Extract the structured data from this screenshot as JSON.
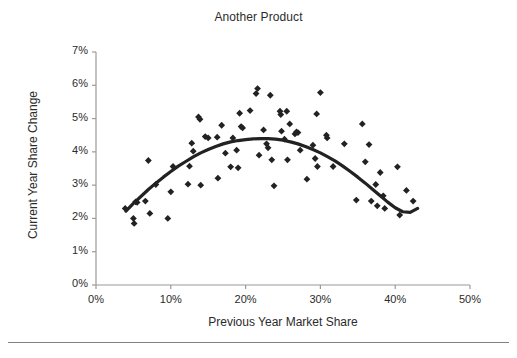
{
  "chart_data": {
    "type": "scatter",
    "title": "Another Product",
    "xlabel": "Previous Year Market Share",
    "ylabel": "Current Year Share Change",
    "xlim": [
      0,
      50
    ],
    "ylim": [
      0,
      7
    ],
    "x_ticks": [
      "0%",
      "10%",
      "20%",
      "30%",
      "40%",
      "50%"
    ],
    "x_tick_values": [
      0,
      10,
      20,
      30,
      40,
      50
    ],
    "y_ticks": [
      "0%",
      "1%",
      "2%",
      "3%",
      "4%",
      "5%",
      "6%",
      "7%"
    ],
    "y_tick_values": [
      0,
      1,
      2,
      3,
      4,
      5,
      6,
      7
    ],
    "grid": false,
    "legend": "none",
    "marker": "diamond",
    "marker_color": "#222222",
    "trendline": {
      "type": "polynomial-quadratic",
      "color": "#222222",
      "width": 3.2,
      "points": [
        [
          4.0,
          2.22
        ],
        [
          5.0,
          2.45
        ],
        [
          6.0,
          2.66
        ],
        [
          7.0,
          2.87
        ],
        [
          8.0,
          3.06
        ],
        [
          9.0,
          3.24
        ],
        [
          10.0,
          3.41
        ],
        [
          11.0,
          3.57
        ],
        [
          12.0,
          3.71
        ],
        [
          13.0,
          3.85
        ],
        [
          14.0,
          3.97
        ],
        [
          15.0,
          4.07
        ],
        [
          16.0,
          4.16
        ],
        [
          17.0,
          4.24
        ],
        [
          18.0,
          4.3
        ],
        [
          19.0,
          4.34
        ],
        [
          20.0,
          4.37
        ],
        [
          21.0,
          4.39
        ],
        [
          22.0,
          4.4
        ],
        [
          23.0,
          4.4
        ],
        [
          24.0,
          4.38
        ],
        [
          25.0,
          4.35
        ],
        [
          26.0,
          4.3
        ],
        [
          27.0,
          4.24
        ],
        [
          28.0,
          4.16
        ],
        [
          29.0,
          4.07
        ],
        [
          30.0,
          3.97
        ],
        [
          31.0,
          3.85
        ],
        [
          32.0,
          3.72
        ],
        [
          33.0,
          3.57
        ],
        [
          34.0,
          3.41
        ],
        [
          35.0,
          3.24
        ],
        [
          36.0,
          3.06
        ],
        [
          37.0,
          2.87
        ],
        [
          38.0,
          2.68
        ],
        [
          39.0,
          2.49
        ],
        [
          40.0,
          2.32
        ],
        [
          41.0,
          2.2
        ],
        [
          42.0,
          2.18
        ],
        [
          43.0,
          2.3
        ]
      ]
    },
    "points": [
      [
        3.9,
        2.3
      ],
      [
        5.0,
        2.0
      ],
      [
        5.1,
        1.85
      ],
      [
        5.3,
        2.5
      ],
      [
        5.5,
        2.48
      ],
      [
        6.6,
        2.52
      ],
      [
        7.0,
        3.74
      ],
      [
        7.2,
        2.15
      ],
      [
        8.0,
        3.02
      ],
      [
        9.6,
        2.0
      ],
      [
        10.0,
        2.8
      ],
      [
        10.3,
        3.56
      ],
      [
        12.3,
        3.03
      ],
      [
        12.5,
        3.57
      ],
      [
        12.8,
        4.26
      ],
      [
        13.0,
        4.02
      ],
      [
        13.7,
        5.05
      ],
      [
        13.9,
        4.98
      ],
      [
        14.0,
        3.0
      ],
      [
        14.6,
        4.46
      ],
      [
        15.0,
        4.42
      ],
      [
        16.2,
        4.44
      ],
      [
        16.3,
        3.21
      ],
      [
        16.8,
        4.8
      ],
      [
        17.3,
        3.96
      ],
      [
        18.0,
        3.55
      ],
      [
        18.3,
        4.42
      ],
      [
        18.8,
        4.05
      ],
      [
        19.0,
        3.52
      ],
      [
        19.2,
        5.16
      ],
      [
        19.4,
        4.76
      ],
      [
        19.6,
        4.72
      ],
      [
        20.6,
        5.24
      ],
      [
        21.4,
        5.75
      ],
      [
        21.6,
        5.9
      ],
      [
        21.8,
        3.9
      ],
      [
        22.4,
        4.66
      ],
      [
        22.8,
        4.24
      ],
      [
        23.0,
        4.12
      ],
      [
        23.3,
        5.7
      ],
      [
        23.5,
        3.76
      ],
      [
        23.8,
        2.98
      ],
      [
        24.6,
        5.22
      ],
      [
        24.7,
        5.12
      ],
      [
        24.8,
        4.62
      ],
      [
        25.2,
        4.38
      ],
      [
        25.5,
        5.22
      ],
      [
        25.6,
        3.76
      ],
      [
        25.9,
        4.84
      ],
      [
        26.6,
        4.54
      ],
      [
        26.8,
        4.6
      ],
      [
        27.0,
        4.58
      ],
      [
        27.3,
        4.05
      ],
      [
        28.2,
        3.18
      ],
      [
        29.0,
        4.2
      ],
      [
        29.3,
        3.8
      ],
      [
        29.5,
        5.14
      ],
      [
        29.6,
        3.56
      ],
      [
        30.0,
        5.78
      ],
      [
        30.8,
        4.5
      ],
      [
        30.9,
        4.42
      ],
      [
        31.7,
        3.56
      ],
      [
        33.2,
        4.24
      ],
      [
        34.8,
        2.55
      ],
      [
        35.6,
        4.84
      ],
      [
        36.0,
        3.7
      ],
      [
        36.5,
        4.22
      ],
      [
        36.8,
        2.52
      ],
      [
        37.4,
        3.02
      ],
      [
        37.6,
        2.38
      ],
      [
        38.0,
        3.38
      ],
      [
        38.4,
        2.68
      ],
      [
        38.6,
        2.3
      ],
      [
        40.3,
        3.55
      ],
      [
        40.6,
        2.1
      ],
      [
        41.5,
        2.84
      ],
      [
        42.4,
        2.52
      ]
    ]
  }
}
